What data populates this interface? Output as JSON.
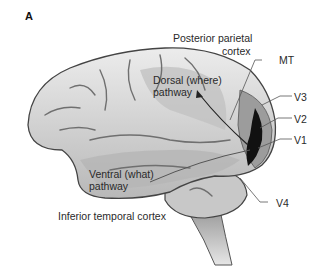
{
  "figure": {
    "panel_label": "A",
    "labels": {
      "posterior_parietal_1": "Posterior parietal",
      "posterior_parietal_2": "cortex",
      "mt": "MT",
      "dorsal_1": "Dorsal (where)",
      "dorsal_2": "pathway",
      "v3": "V3",
      "v2": "V2",
      "v1": "V1",
      "ventral_1": "Ventral (what)",
      "ventral_2": "pathway",
      "v4": "V4",
      "inferior_temporal": "Inferior temporal cortex"
    },
    "colors": {
      "cortex": "#d9d9d9",
      "sulci": "#7a7a7a",
      "visual_area_dark": "#111111",
      "pathway_shade": "#a8a8a8"
    }
  }
}
